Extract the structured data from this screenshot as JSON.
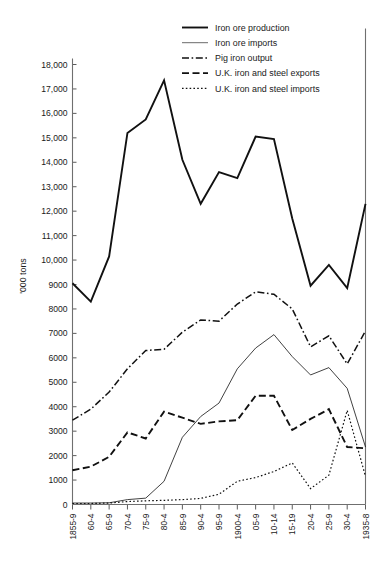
{
  "chart_data": {
    "type": "line",
    "title": "",
    "xlabel": "",
    "ylabel": "'000 tons",
    "ylim": [
      0,
      18000
    ],
    "ytick_step": 1000,
    "grid": false,
    "legend_position": "top-right",
    "categories": [
      "1855-9",
      "60-4",
      "65-9",
      "70-4",
      "75-9",
      "80-4",
      "85-9",
      "90-4",
      "95-9",
      "1900-4",
      "05-9",
      "10-14",
      "15-19",
      "20-4",
      "25-9",
      "30-4",
      "1935-8"
    ],
    "ytick_labels": [
      "0",
      "1000",
      "2000",
      "3000",
      "4000",
      "5000",
      "6000",
      "7000",
      "8000",
      "9000",
      "10,000",
      "11,000",
      "12,000",
      "13,000",
      "14,000",
      "15,000",
      "16,000",
      "17,000",
      "18,000"
    ],
    "series": [
      {
        "name": "Iron ore production",
        "style": "solid",
        "width": 1.9,
        "color": "#111111",
        "values": [
          9050,
          8300,
          10150,
          15200,
          15750,
          17350,
          14100,
          12300,
          13600,
          13350,
          15050,
          14950,
          11700,
          8950,
          9800,
          8850,
          12300
        ]
      },
      {
        "name": "Iron ore imports",
        "style": "solid",
        "width": 0.8,
        "color": "#444444",
        "values": [
          60,
          60,
          70,
          200,
          260,
          950,
          2750,
          3600,
          4150,
          5550,
          6400,
          6950,
          6050,
          5300,
          5600,
          4750,
          2350
        ]
      },
      {
        "name": "Pig iron output",
        "style": "dashdot",
        "width": 1.5,
        "color": "#111111",
        "values": [
          3450,
          3900,
          4600,
          5550,
          6300,
          6350,
          7050,
          7550,
          7500,
          8200,
          8700,
          8600,
          8000,
          6450,
          6900,
          5750,
          7100
        ]
      },
      {
        "name": "U.K. iron and steel exports",
        "style": "dashed",
        "width": 1.9,
        "color": "#111111",
        "values": [
          1400,
          1550,
          1950,
          2950,
          2700,
          3800,
          3550,
          3300,
          3400,
          3450,
          4450,
          4450,
          3050,
          3500,
          3900,
          2350,
          2300
        ]
      },
      {
        "name": "U.K. iron and steel imports",
        "style": "dotted",
        "width": 1.2,
        "color": "#111111",
        "values": [
          40,
          40,
          60,
          120,
          150,
          170,
          200,
          250,
          420,
          950,
          1100,
          1350,
          1700,
          650,
          1200,
          3850,
          1150
        ]
      }
    ]
  },
  "legend": {
    "items": [
      {
        "label": "Iron ore production"
      },
      {
        "label": "Iron ore imports"
      },
      {
        "label": "Pig iron output"
      },
      {
        "label": "U.K. iron and steel exports"
      },
      {
        "label": "U.K. iron and steel imports"
      }
    ]
  }
}
